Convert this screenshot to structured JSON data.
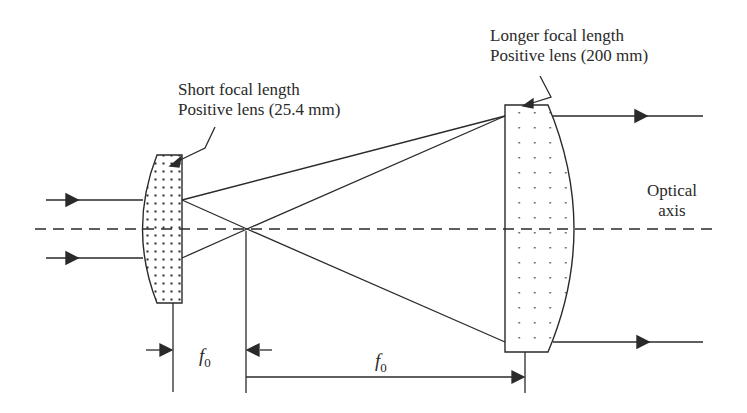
{
  "diagram": {
    "labels": {
      "short_lens_line1": "Short focal length",
      "short_lens_line2": "Positive lens (25.4 mm)",
      "long_lens_line1": "Longer focal length",
      "long_lens_line2": "Positive lens (200 mm)",
      "axis_line1": "Optical",
      "axis_line2": "axis",
      "focal_short_symbol": "f",
      "focal_short_sub": "0",
      "focal_long_symbol": "f",
      "focal_long_sub": "0"
    },
    "components": [
      {
        "id": "short-lens",
        "type": "plano-convex lens",
        "focal_length": "25.4 mm"
      },
      {
        "id": "long-lens",
        "type": "plano-convex lens",
        "focal_length": "200 mm"
      }
    ],
    "colors": {
      "stroke": "#2a2a2a",
      "background": "#ffffff"
    }
  }
}
